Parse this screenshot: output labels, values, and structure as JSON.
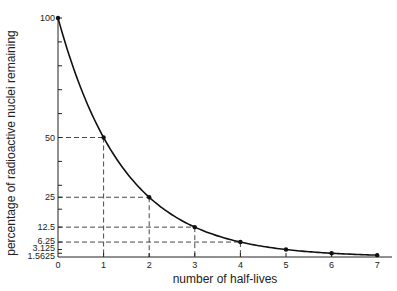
{
  "chart_data": {
    "type": "line",
    "title": "",
    "xlabel": "number of half-lives",
    "ylabel": "percentage of radioactive nuclei remaining",
    "x": [
      0,
      1,
      2,
      3,
      4,
      5,
      6,
      7
    ],
    "series": [
      {
        "name": "radioactive decay",
        "values": [
          100,
          50,
          25,
          12.5,
          6.25,
          3.125,
          1.5625,
          0.78125
        ],
        "color": "#111111",
        "markers": true,
        "smooth": true
      }
    ],
    "xticks": [
      "0",
      "1",
      "2",
      "3",
      "4",
      "5",
      "6",
      "7"
    ],
    "yticks_labeled": [
      {
        "value": 100,
        "label": "100"
      },
      {
        "value": 50,
        "label": "50"
      },
      {
        "value": 25,
        "label": "25"
      },
      {
        "value": 12.5,
        "label": "12.5"
      },
      {
        "value": 6.25,
        "label": "6.25"
      },
      {
        "value": 3.125,
        "label": "3.125"
      },
      {
        "value": 1.5625,
        "label": "1.5625"
      }
    ],
    "yticks_minor": [
      90,
      80,
      70,
      60,
      40,
      30,
      20
    ],
    "guide_lines": [
      {
        "x": 1,
        "y": 50
      },
      {
        "x": 2,
        "y": 25
      },
      {
        "x": 3,
        "y": 12.5
      },
      {
        "x": 4,
        "y": 6.25
      }
    ],
    "xlim": [
      0,
      7.3
    ],
    "ylim": [
      0,
      100
    ],
    "grid": false,
    "legend": null
  }
}
